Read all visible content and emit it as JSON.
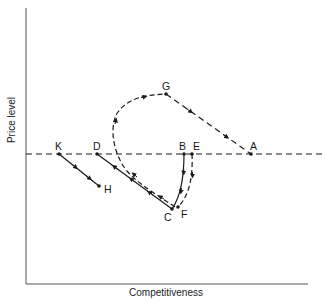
{
  "diagram": {
    "x_axis_label": "Competitiveness",
    "y_axis_label": "Price level",
    "colors": {
      "ink": "#1a1a1a",
      "axis": "#555555",
      "background": "#ffffff"
    },
    "reference_line": {
      "style": "dashed",
      "y_level": "equal to A, B, D, E, K"
    },
    "points": [
      {
        "id": "A",
        "label": "A"
      },
      {
        "id": "B",
        "label": "B"
      },
      {
        "id": "C",
        "label": "C"
      },
      {
        "id": "D",
        "label": "D"
      },
      {
        "id": "E",
        "label": "E"
      },
      {
        "id": "F",
        "label": "F"
      },
      {
        "id": "G",
        "label": "G"
      },
      {
        "id": "H",
        "label": "H"
      },
      {
        "id": "K",
        "label": "K"
      }
    ],
    "paths": [
      {
        "from": "B",
        "to": "C",
        "style": "solid",
        "direction": "downward"
      },
      {
        "from": "C",
        "to": "D",
        "style": "solid",
        "direction": "up-left"
      },
      {
        "from": "K",
        "to": "H",
        "style": "solid",
        "direction": "down-right"
      },
      {
        "from": "E",
        "to": "F",
        "style": "dashed",
        "direction": "downward"
      },
      {
        "from": "F",
        "to": "G",
        "style": "dashed",
        "direction": "up-left then loop right"
      },
      {
        "from": "G",
        "to": "A",
        "style": "dashed",
        "direction": "down-right"
      }
    ]
  }
}
